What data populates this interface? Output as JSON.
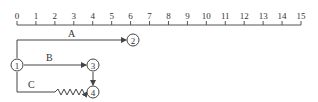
{
  "timescale": {
    "ticks": [
      "0",
      "1",
      "2",
      "3",
      "4",
      "5",
      "6",
      "7",
      "8",
      "9",
      "10",
      "11",
      "12",
      "13",
      "14",
      "15"
    ]
  },
  "activities": {
    "A": {
      "label": "A"
    },
    "B": {
      "label": "B"
    },
    "C": {
      "label": "C"
    }
  },
  "nodes": {
    "n1": {
      "label": "1"
    },
    "n2": {
      "label": "2"
    },
    "n3": {
      "label": "3"
    },
    "n4": {
      "label": "4"
    }
  },
  "colors": {
    "line": "#444444",
    "text": "#333333"
  }
}
